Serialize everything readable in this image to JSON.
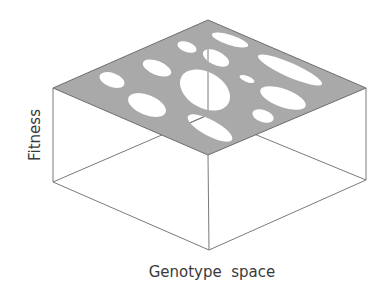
{
  "figure": {
    "ylabel": "Fitness",
    "xlabel": "Genotype  space",
    "colors": {
      "plane_fill": "#a9a9a9",
      "plane_edge": "#6a6a6a",
      "box_edge": "#7a7a7a",
      "hole_fill": "#ffffff",
      "label_text": "#3a3a3a"
    },
    "box": {
      "top_face": [
        [
          53,
          88
        ],
        [
          208,
          20
        ],
        [
          366,
          88
        ],
        [
          208,
          155
        ]
      ],
      "bottom_face": [
        [
          53,
          182
        ],
        [
          208,
          115
        ],
        [
          366,
          180
        ],
        [
          209,
          250
        ]
      ]
    },
    "holes": [
      {
        "cx": 112,
        "cy": 80,
        "rx": 13,
        "ry": 7,
        "rot": 20
      },
      {
        "cx": 157,
        "cy": 68,
        "rx": 15,
        "ry": 7,
        "rot": 22
      },
      {
        "cx": 147,
        "cy": 105,
        "rx": 20,
        "ry": 10,
        "rot": 22
      },
      {
        "cx": 187,
        "cy": 47,
        "rx": 10,
        "ry": 5,
        "rot": 20
      },
      {
        "cx": 205,
        "cy": 90,
        "rx": 27,
        "ry": 18,
        "rot": 30
      },
      {
        "cx": 216,
        "cy": 58,
        "rx": 14,
        "ry": 7,
        "rot": 25
      },
      {
        "cx": 230,
        "cy": 40,
        "rx": 19,
        "ry": 5,
        "rot": 18
      },
      {
        "cx": 247,
        "cy": 79,
        "rx": 8,
        "ry": 3,
        "rot": 22
      },
      {
        "cx": 290,
        "cy": 70,
        "rx": 35,
        "ry": 7,
        "rot": 24
      },
      {
        "cx": 283,
        "cy": 98,
        "rx": 24,
        "ry": 9,
        "rot": 20
      },
      {
        "cx": 263,
        "cy": 116,
        "rx": 11,
        "ry": 6,
        "rot": 18
      },
      {
        "cx": 210,
        "cy": 128,
        "rx": 25,
        "ry": 8,
        "rot": 28
      }
    ]
  }
}
